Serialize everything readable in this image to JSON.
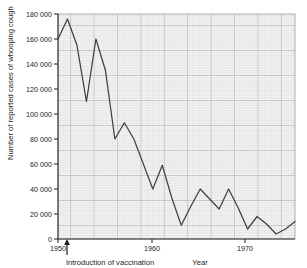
{
  "chart_data": {
    "type": "line",
    "title": "",
    "xlabel": "Year",
    "ylabel": "Number of reported cases of whooping cough",
    "xlim": [
      1950,
      1975
    ],
    "ylim": [
      0,
      180000
    ],
    "grid": true,
    "grid_minor": true,
    "legend": "none",
    "x_tick_labels": [
      "1950",
      "1960",
      "1970"
    ],
    "x_tick_values": [
      1950,
      1960,
      1970
    ],
    "y_tick_labels": [
      "0",
      "20 000",
      "40 000",
      "60 000",
      "80 000",
      "100 000",
      "120 000",
      "140 000",
      "160 000",
      "180 000"
    ],
    "y_tick_values": [
      0,
      20000,
      40000,
      60000,
      80000,
      100000,
      120000,
      140000,
      160000,
      180000
    ],
    "x": [
      1950,
      1951,
      1952,
      1953,
      1954,
      1955,
      1956,
      1957,
      1958,
      1959,
      1960,
      1961,
      1962,
      1963,
      1964,
      1965,
      1966,
      1967,
      1968,
      1969,
      1970,
      1971,
      1972,
      1973,
      1974,
      1975
    ],
    "values": [
      160000,
      176000,
      155000,
      110000,
      160000,
      135000,
      80000,
      93000,
      80000,
      60000,
      40000,
      59000,
      33000,
      11000,
      26000,
      40000,
      32000,
      24000,
      40000,
      25000,
      8000,
      18000,
      12000,
      4000,
      8000,
      14000
    ],
    "series": [
      {
        "name": "Reported cases of whooping cough",
        "color": "#404040",
        "values": [
          160000,
          176000,
          155000,
          110000,
          160000,
          135000,
          80000,
          93000,
          80000,
          60000,
          40000,
          59000,
          33000,
          11000,
          26000,
          40000,
          32000,
          24000,
          40000,
          25000,
          8000,
          18000,
          12000,
          4000,
          8000,
          14000
        ]
      }
    ],
    "annotations": [
      {
        "name": "introduction-of-vaccination",
        "text": "Introduction of vaccination",
        "x": 1952,
        "y": 0,
        "marker": "up-arrow"
      }
    ],
    "colors": {
      "line": "#404040",
      "axis": "#303030",
      "grid_major": "#9a9a9a",
      "grid_minor": "#c8c8c8",
      "plot_background": "#f2f2f2",
      "text": "#1c1c1c"
    }
  }
}
